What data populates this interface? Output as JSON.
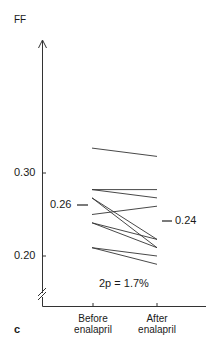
{
  "chart_data": {
    "type": "line",
    "subtype": "paired-slope",
    "title": "",
    "panel_label": "c",
    "xlabel": "",
    "ylabel": "FF",
    "categories": [
      "Before enalapril",
      "After enalapril"
    ],
    "ylim": [
      0.15,
      0.36
    ],
    "yticks": [
      0.2,
      0.3
    ],
    "ytick_labels": [
      "0.20",
      "0.30"
    ],
    "axis_break": true,
    "grid": false,
    "legend": null,
    "series": [
      {
        "name": "subject-1",
        "values": [
          0.33,
          0.32
        ]
      },
      {
        "name": "subject-2",
        "values": [
          0.28,
          0.28
        ]
      },
      {
        "name": "subject-3",
        "values": [
          0.28,
          0.27
        ]
      },
      {
        "name": "subject-4",
        "values": [
          0.27,
          0.22
        ]
      },
      {
        "name": "subject-5",
        "values": [
          0.27,
          0.21
        ]
      },
      {
        "name": "subject-6",
        "values": [
          0.25,
          0.26
        ]
      },
      {
        "name": "subject-7",
        "values": [
          0.24,
          0.22
        ]
      },
      {
        "name": "subject-8",
        "values": [
          0.24,
          0.21
        ]
      },
      {
        "name": "subject-9",
        "values": [
          0.21,
          0.2
        ]
      },
      {
        "name": "subject-10",
        "values": [
          0.21,
          0.19
        ]
      }
    ],
    "annotations": [
      {
        "text": "0.26",
        "position": "left of Before",
        "value": 0.26,
        "meaning": "mean before"
      },
      {
        "text": "0.24",
        "position": "right of After",
        "value": 0.24,
        "meaning": "mean after"
      },
      {
        "text": "2p = 1.7%",
        "position": "bottom center"
      }
    ]
  },
  "labels": {
    "ylabel": "FF",
    "ytick_030": "0.30",
    "ytick_020": "0.20",
    "mean_before": "0.26",
    "mean_after": "0.24",
    "pvalue": "2p = 1.7%",
    "cat_before": "Before enalapril",
    "cat_after": "After enalapril",
    "panel": "c"
  },
  "colors": {
    "ink": "#1a1a1a",
    "background": "#ffffff"
  }
}
